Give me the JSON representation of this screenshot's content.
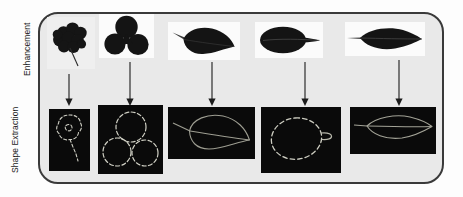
{
  "figure": {
    "background_color": "#e9e9e9",
    "border_color": "#3a3a3a",
    "panel_dark_color": "#0a0a0a",
    "panel_light_color": "#fbfbfb",
    "contour_color": "#cfcfc4",
    "arrow_color": "#1c1c1c",
    "leaf_color": "#151515"
  },
  "rows": [
    {
      "key": "enhancement",
      "label": "Enhancement",
      "items": [
        {
          "name": "lobed-round-leaf",
          "caption": "Enhanced leaf image 1"
        },
        {
          "name": "trifoliate-leaf",
          "caption": "Enhanced leaf image 2"
        },
        {
          "name": "ovate-leaf",
          "caption": "Enhanced leaf image 3"
        },
        {
          "name": "elliptic-leaf",
          "caption": "Enhanced leaf image 4"
        },
        {
          "name": "lanceolate-leaf",
          "caption": "Enhanced leaf image 5"
        }
      ]
    },
    {
      "key": "shape_extraction",
      "label": "Shape Extraction",
      "items": [
        {
          "name": "lobed-round-contour",
          "caption": "Extracted shape 1"
        },
        {
          "name": "trifoliate-contour",
          "caption": "Extracted shape 2"
        },
        {
          "name": "ovate-contour",
          "caption": "Extracted shape 3"
        },
        {
          "name": "elliptic-contour",
          "caption": "Extracted shape 4"
        },
        {
          "name": "lanceolate-contour",
          "caption": "Extracted shape 5"
        }
      ]
    }
  ],
  "arrows": [
    {
      "name": "arrow-column-1"
    },
    {
      "name": "arrow-column-2"
    },
    {
      "name": "arrow-column-3"
    },
    {
      "name": "arrow-column-4"
    },
    {
      "name": "arrow-column-5"
    }
  ]
}
